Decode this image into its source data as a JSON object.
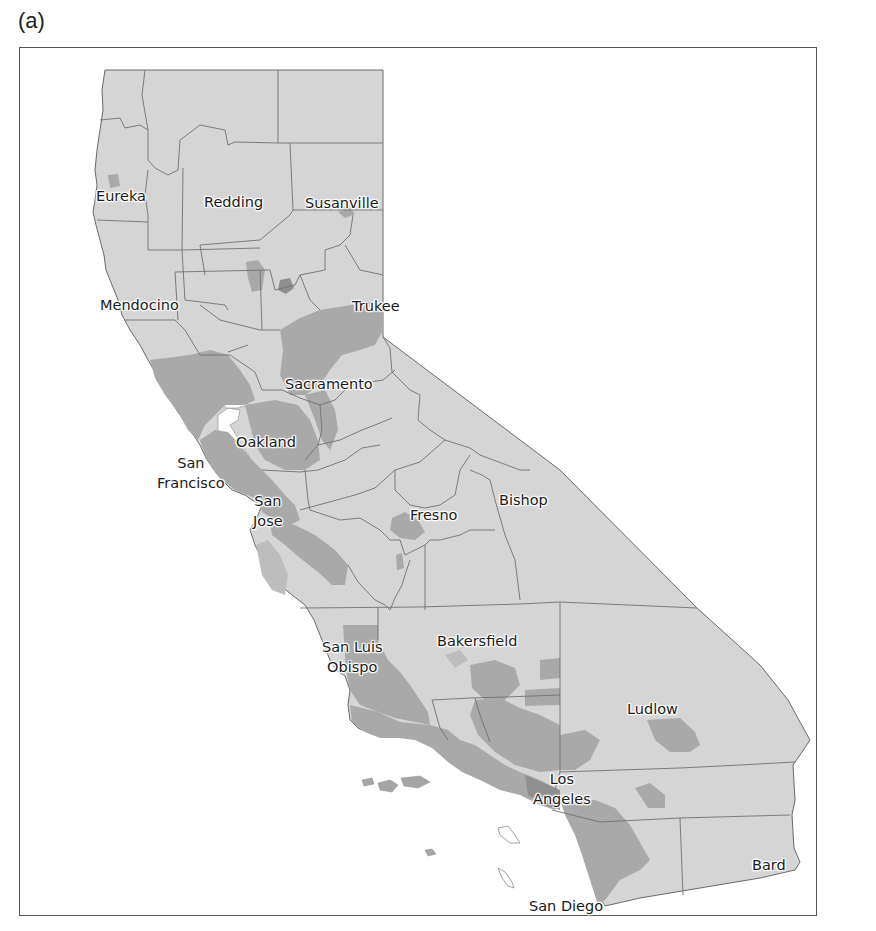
{
  "figure": {
    "panel_label": "(a)",
    "colors": {
      "background": "#ffffff",
      "land_light": "#d5d5d5",
      "land_dark": "#a9a9a9",
      "land_darker": "#8f8f8f",
      "boundary": "#6a6a6a",
      "frame": "#555555"
    }
  },
  "map": {
    "region": "California",
    "cities": [
      {
        "id": "eureka",
        "lines": [
          "Eureka"
        ]
      },
      {
        "id": "redding",
        "lines": [
          "Redding"
        ]
      },
      {
        "id": "susanville",
        "lines": [
          "Susanville"
        ]
      },
      {
        "id": "mendocino",
        "lines": [
          "Mendocino"
        ]
      },
      {
        "id": "trukee",
        "lines": [
          "Trukee"
        ]
      },
      {
        "id": "sacramento",
        "lines": [
          "Sacramento"
        ]
      },
      {
        "id": "oakland",
        "lines": [
          "Oakland"
        ]
      },
      {
        "id": "san-francisco",
        "lines": [
          "San",
          "Francisco"
        ]
      },
      {
        "id": "san-jose",
        "lines": [
          "San",
          "Jose"
        ]
      },
      {
        "id": "fresno",
        "lines": [
          "Fresno"
        ]
      },
      {
        "id": "bishop",
        "lines": [
          "Bishop"
        ]
      },
      {
        "id": "san-luis-obispo",
        "lines": [
          "San Luis",
          "Obispo"
        ]
      },
      {
        "id": "bakersfield",
        "lines": [
          "Bakersfield"
        ]
      },
      {
        "id": "ludlow",
        "lines": [
          "Ludlow"
        ]
      },
      {
        "id": "los-angeles",
        "lines": [
          "Los",
          "Angeles"
        ]
      },
      {
        "id": "bard",
        "lines": [
          "Bard"
        ]
      },
      {
        "id": "san-diego",
        "lines": [
          "San Diego"
        ]
      }
    ]
  }
}
